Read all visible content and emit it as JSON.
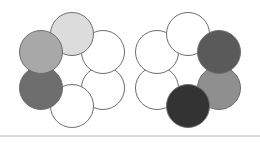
{
  "figure": {
    "canvas": {
      "width": 260,
      "height": 142,
      "background": "#ffffff"
    },
    "baseline_rule": {
      "name": "horizontal-rule",
      "color": "#b9b9b9",
      "x1": 0,
      "x2": 260,
      "y": 136
    },
    "style": {
      "edge_color": "#4a4a4a",
      "edge_width": 1.05,
      "circle_stroke": "#6d6d6d",
      "circle_stroke_width": 1.0,
      "circle_radius": 21.5
    },
    "panels": [
      {
        "id": "left-ring",
        "label": "Left hexagonal ring",
        "center": {
          "x": 72,
          "y": 70
        },
        "ring_radius": 36,
        "nodes": [
          {
            "position": "top",
            "label": "node-top",
            "cx": 72,
            "cy": 34,
            "r": 21.5,
            "fill": "#dcdcdc",
            "shade": "light-gray"
          },
          {
            "position": "upper-right",
            "label": "node-upper-right",
            "cx": 103,
            "cy": 52,
            "r": 21.5,
            "fill": "#ffffff",
            "shade": "white"
          },
          {
            "position": "lower-right",
            "label": "node-lower-right",
            "cx": 103,
            "cy": 88,
            "r": 21.5,
            "fill": "#ffffff",
            "shade": "white"
          },
          {
            "position": "bottom",
            "label": "node-bottom",
            "cx": 72,
            "cy": 106,
            "r": 21.5,
            "fill": "#ffffff",
            "shade": "white"
          },
          {
            "position": "lower-left",
            "label": "node-lower-left",
            "cx": 41,
            "cy": 88,
            "r": 21.5,
            "fill": "#6e6e6e",
            "shade": "dark-gray"
          },
          {
            "position": "upper-left",
            "label": "node-upper-left",
            "cx": 41,
            "cy": 52,
            "r": 21.5,
            "fill": "#a8a8a8",
            "shade": "medium-gray"
          }
        ]
      },
      {
        "id": "right-ring",
        "label": "Right hexagonal ring",
        "center": {
          "x": 188,
          "y": 70
        },
        "ring_radius": 36,
        "nodes": [
          {
            "position": "top",
            "label": "node-top",
            "cx": 188,
            "cy": 34,
            "r": 21.5,
            "fill": "#ffffff",
            "shade": "white"
          },
          {
            "position": "upper-right",
            "label": "node-upper-right",
            "cx": 219,
            "cy": 52,
            "r": 21.5,
            "fill": "#5a5a5a",
            "shade": "dark-gray"
          },
          {
            "position": "lower-right",
            "label": "node-lower-right",
            "cx": 219,
            "cy": 88,
            "r": 21.5,
            "fill": "#8f8f8f",
            "shade": "medium-gray"
          },
          {
            "position": "bottom",
            "label": "node-bottom",
            "cx": 188,
            "cy": 106,
            "r": 21.5,
            "fill": "#333333",
            "shade": "near-black"
          },
          {
            "position": "lower-left",
            "label": "node-lower-left",
            "cx": 157,
            "cy": 88,
            "r": 21.5,
            "fill": "#ffffff",
            "shade": "white"
          },
          {
            "position": "upper-left",
            "label": "node-upper-left",
            "cx": 157,
            "cy": 52,
            "r": 21.5,
            "fill": "#ffffff",
            "shade": "white"
          }
        ]
      }
    ]
  }
}
